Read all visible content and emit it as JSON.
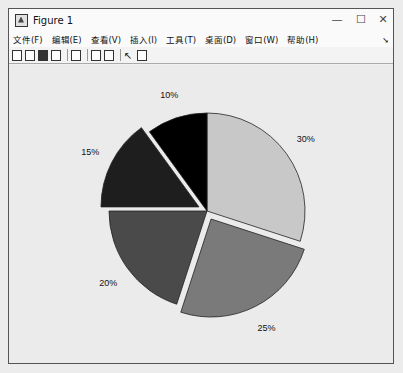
{
  "window": {
    "title": "Figure 1",
    "controls": {
      "minimize": "—",
      "maximize": "☐",
      "close": "✕"
    }
  },
  "menu": {
    "items": [
      "文件(F)",
      "编辑(E)",
      "查看(V)",
      "插入(I)",
      "工具(T)",
      "桌面(D)",
      "窗口(W)",
      "帮助(H)"
    ],
    "overflow_arrow": "➘"
  },
  "toolbar": {
    "icons": [
      "new-figure-icon",
      "open-file-icon",
      "save-icon",
      "print-icon",
      "link-icon",
      "colorbar-icon",
      "legend-icon",
      "pointer-icon",
      "property-editor-icon"
    ]
  },
  "chart_data": {
    "type": "pie",
    "title": "",
    "labels": [
      "30%",
      "25%",
      "20%",
      "15%",
      "10%"
    ],
    "values": [
      30,
      25,
      20,
      15,
      10
    ],
    "exploded": [
      false,
      true,
      false,
      true,
      false
    ],
    "colors": [
      "#c8c8c8",
      "#7a7a7a",
      "#4a4a4a",
      "#1e1e1e",
      "#000000"
    ],
    "start": "top",
    "direction": "clockwise",
    "legend": "none"
  }
}
